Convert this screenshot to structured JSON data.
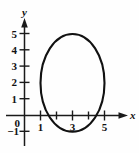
{
  "figure": {
    "kind": "coordinate-plane-graph",
    "background_color": "#fefefe",
    "ink_color": "#111111"
  },
  "axes": {
    "x_axis_label": "x",
    "y_axis_label": "y",
    "origin_label": "0",
    "x_ticks": [
      {
        "value": 1,
        "label": "1"
      },
      {
        "value": 2,
        "label": ""
      },
      {
        "value": 3,
        "label": "3"
      },
      {
        "value": 4,
        "label": ""
      },
      {
        "value": 5,
        "label": "5"
      }
    ],
    "y_ticks": [
      {
        "value": 5,
        "label": "5"
      },
      {
        "value": 4,
        "label": "4"
      },
      {
        "value": 3,
        "label": "3"
      },
      {
        "value": 2,
        "label": "2"
      },
      {
        "value": 1,
        "label": "1"
      },
      {
        "value": 0,
        "label": "0"
      },
      {
        "value": -1,
        "label": "−1"
      }
    ],
    "xlim": [
      -0.4,
      6.5
    ],
    "ylim": [
      -1.6,
      6.0
    ],
    "grid": false
  },
  "chart_data": {
    "type": "line",
    "title": "",
    "xlabel": "x",
    "ylabel": "y",
    "xlim": [
      -0.4,
      6.5
    ],
    "ylim": [
      -1.6,
      6.0
    ],
    "grid": false,
    "legend": "none",
    "series": [
      {
        "name": "ellipse",
        "shape": "ellipse",
        "center": [
          3,
          2
        ],
        "semi_axis_x": 2,
        "semi_axis_y": 3,
        "x_intercept_range": [
          1,
          5
        ],
        "y_extent_range": [
          -1,
          5
        ],
        "closed": true
      }
    ],
    "annotations": []
  }
}
